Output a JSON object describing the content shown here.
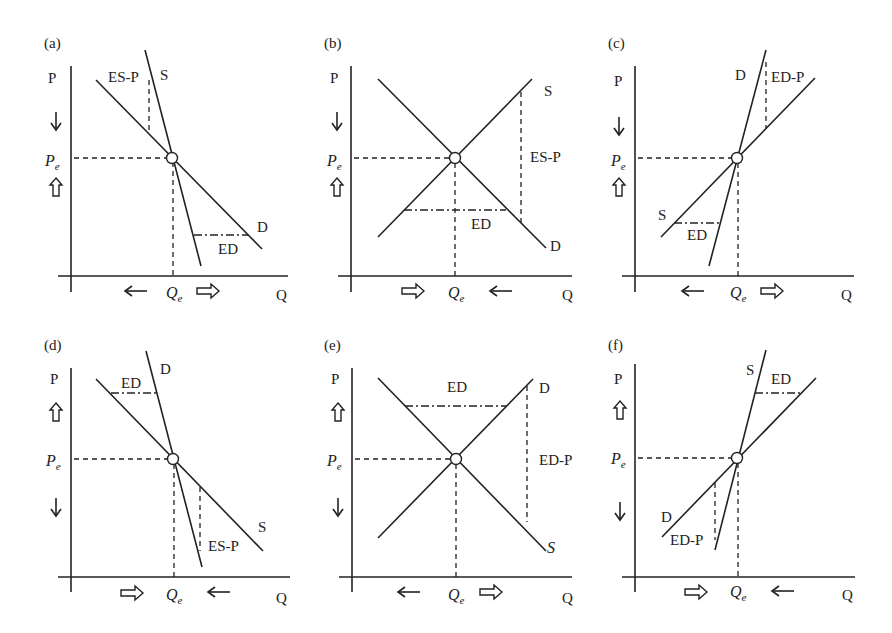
{
  "figure": {
    "axis_labels": {
      "y": "P",
      "x": "Q",
      "price_eq": "P",
      "price_eq_sub": "e",
      "qty_eq": "Q",
      "qty_eq_sub": "e"
    },
    "panels": [
      {
        "id": "a",
        "tag": "(a)",
        "curve1_label": "S",
        "curve2_label": "D",
        "vertical_gap_label": "ES-P",
        "horizontal_gap_label": "ED",
        "price_arrows": {
          "above": "down-thin",
          "below": "up-hollow"
        },
        "qty_arrows": {
          "left": "left-thin",
          "right": "right-hollow"
        }
      },
      {
        "id": "b",
        "tag": "(b)",
        "curve1_label": "S",
        "curve2_label": "D",
        "vertical_gap_label": "ES-P",
        "horizontal_gap_label": "ED",
        "price_arrows": {
          "above": "down-thin",
          "below": "up-hollow"
        },
        "qty_arrows": {
          "left": "right-hollow",
          "right": "left-thin"
        }
      },
      {
        "id": "c",
        "tag": "(c)",
        "curve1_label": "D",
        "curve2_label": "S",
        "vertical_gap_label": "ED-P",
        "horizontal_gap_label": "ED",
        "price_arrows": {
          "above": "down-thin",
          "below": "up-hollow"
        },
        "qty_arrows": {
          "left": "left-thin",
          "right": "right-hollow"
        }
      },
      {
        "id": "d",
        "tag": "(d)",
        "curve1_label": "D",
        "curve2_label": "S",
        "vertical_gap_label": "ES-P",
        "horizontal_gap_label": "ED",
        "price_arrows": {
          "above": "up-hollow",
          "below": "down-thin"
        },
        "qty_arrows": {
          "left": "right-hollow",
          "right": "left-thin"
        }
      },
      {
        "id": "e",
        "tag": "(e)",
        "curve1_label": "D",
        "curve2_label": "S",
        "vertical_gap_label": "ED-P",
        "horizontal_gap_label": "ED",
        "price_arrows": {
          "above": "up-hollow",
          "below": "down-thin"
        },
        "qty_arrows": {
          "left": "left-thin",
          "right": "right-hollow"
        }
      },
      {
        "id": "f",
        "tag": "(f)",
        "curve1_label": "S",
        "curve2_label": "D",
        "vertical_gap_label": "ED-P",
        "horizontal_gap_label": "ED",
        "price_arrows": {
          "above": "up-hollow",
          "below": "down-thin"
        },
        "qty_arrows": {
          "left": "right-hollow",
          "right": "left-thin"
        }
      }
    ]
  },
  "colors": {
    "ink": "#222222",
    "background": "#ffffff"
  }
}
